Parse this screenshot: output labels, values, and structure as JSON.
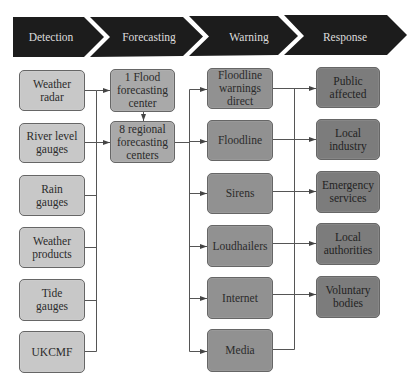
{
  "header": {
    "stages": [
      {
        "label": "Detection"
      },
      {
        "label": "Forecasting"
      },
      {
        "label": "Warning"
      },
      {
        "label": "Response"
      }
    ]
  },
  "columns": {
    "detection": {
      "items": [
        {
          "label": "Weather\nradar"
        },
        {
          "label": "River level\ngauges"
        },
        {
          "label": "Rain\ngauges"
        },
        {
          "label": "Weather\nproducts"
        },
        {
          "label": "Tide\ngauges"
        },
        {
          "label": "UKCMF"
        }
      ]
    },
    "forecasting": {
      "items": [
        {
          "label": "1 Flood\nforecasting\ncenter"
        },
        {
          "label": "8 regional\nforecasting\ncenters"
        }
      ]
    },
    "warning": {
      "items": [
        {
          "label": "Floodline\nwarnings\ndirect"
        },
        {
          "label": "Floodline"
        },
        {
          "label": "Sirens"
        },
        {
          "label": "Loudhailers"
        },
        {
          "label": "Internet"
        },
        {
          "label": "Media"
        }
      ]
    },
    "response": {
      "items": [
        {
          "label": "Public\naffected"
        },
        {
          "label": "Local\nindustry"
        },
        {
          "label": "Emergency\nservices"
        },
        {
          "label": "Local\nauthorities"
        },
        {
          "label": "Voluntary\nbodies"
        }
      ]
    }
  },
  "colors": {
    "header_bg": "#1c1c1c",
    "header_text": "#dcdcdc",
    "detection_fill": "#c8c8c8",
    "forecasting_fill": "#a9a9a9",
    "warning_fill": "#919191",
    "response_fill": "#7c7c7c",
    "connector": "#555555"
  }
}
